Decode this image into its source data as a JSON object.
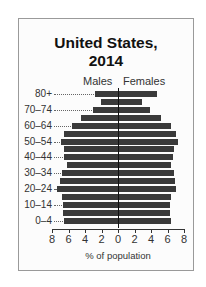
{
  "chart_data": {
    "type": "bar",
    "subtype": "population-pyramid",
    "title": "United States, 2014",
    "title_lines": [
      "United States,",
      "2014"
    ],
    "xlabel": "% of population",
    "ylabel": "",
    "legend": [
      "Males",
      "Females"
    ],
    "categories": [
      "0–4",
      "5–9",
      "10–14",
      "15–19",
      "20–24",
      "25–29",
      "30–34",
      "35–39",
      "40–44",
      "45–49",
      "50–54",
      "55–59",
      "60–64",
      "65–69",
      "70–74",
      "75–79",
      "80+"
    ],
    "labeled_categories": [
      "0–4",
      "10–14",
      "20–24",
      "30–34",
      "40–44",
      "50–54",
      "60–64",
      "70–74",
      "80+"
    ],
    "series": [
      {
        "name": "Males",
        "values": [
          6.6,
          6.7,
          6.7,
          6.8,
          7.4,
          7.0,
          6.8,
          6.2,
          6.5,
          6.5,
          6.9,
          6.5,
          5.6,
          4.5,
          3.0,
          2.1,
          2.8
        ]
      },
      {
        "name": "Females",
        "values": [
          6.3,
          6.2,
          6.2,
          6.3,
          6.9,
          6.8,
          6.7,
          6.3,
          6.5,
          6.7,
          7.1,
          6.9,
          6.3,
          5.1,
          3.7,
          2.8,
          4.6
        ]
      }
    ],
    "xticks": [
      "8",
      "6",
      "4",
      "2",
      "0",
      "2",
      "4",
      "6",
      "8"
    ],
    "xlim": [
      -8,
      8
    ],
    "grid": false,
    "bar_color": "#3a3a3a"
  }
}
